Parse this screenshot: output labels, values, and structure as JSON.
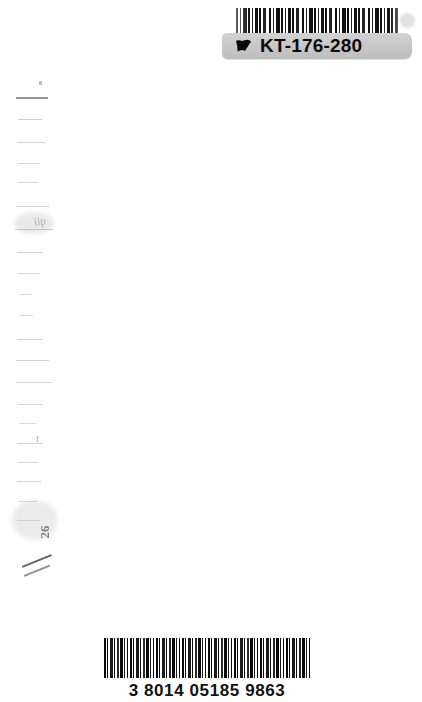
{
  "page": {
    "background_color": "#ffffff",
    "width": 422,
    "height": 702
  },
  "library_label": {
    "code_text": "KT-176-280",
    "flag_icon": "flag-icon",
    "band_color": "#c9c9c9",
    "text_color": "#0d0d0d",
    "barcode_symbology_label": "barcode-code39",
    "dot_color": "#e2e2e2"
  },
  "product_barcode": {
    "number": "3 8014 05185 9863",
    "bar_color": "#0a0a0a",
    "text_color": "#111111"
  },
  "edge_marks": {
    "label": "bleed-through dashes",
    "color": "#8f8f8f",
    "dashes": [
      {
        "x": 16,
        "y": 97,
        "w": 32,
        "h": 2,
        "o": 0.95
      },
      {
        "x": 18,
        "y": 119,
        "w": 24,
        "h": 1,
        "o": 0.4
      },
      {
        "x": 17,
        "y": 142,
        "w": 28,
        "h": 1,
        "o": 0.38
      },
      {
        "x": 18,
        "y": 163,
        "w": 22,
        "h": 1,
        "o": 0.36
      },
      {
        "x": 18,
        "y": 182,
        "w": 20,
        "h": 1,
        "o": 0.34
      },
      {
        "x": 16,
        "y": 206,
        "w": 33,
        "h": 1,
        "o": 0.42
      },
      {
        "x": 15,
        "y": 229,
        "w": 38,
        "h": 1,
        "o": 0.45
      },
      {
        "x": 17,
        "y": 252,
        "w": 26,
        "h": 1,
        "o": 0.4
      },
      {
        "x": 18,
        "y": 273,
        "w": 22,
        "h": 1,
        "o": 0.34
      },
      {
        "x": 19,
        "y": 294,
        "w": 13,
        "h": 1,
        "o": 0.32
      },
      {
        "x": 19,
        "y": 315,
        "w": 14,
        "h": 1,
        "o": 0.32
      },
      {
        "x": 17,
        "y": 339,
        "w": 25,
        "h": 1,
        "o": 0.38
      },
      {
        "x": 16,
        "y": 360,
        "w": 33,
        "h": 1,
        "o": 0.42
      },
      {
        "x": 16,
        "y": 382,
        "w": 36,
        "h": 1,
        "o": 0.4
      },
      {
        "x": 18,
        "y": 404,
        "w": 24,
        "h": 1,
        "o": 0.36
      },
      {
        "x": 19,
        "y": 423,
        "w": 17,
        "h": 1,
        "o": 0.32
      },
      {
        "x": 17,
        "y": 443,
        "w": 26,
        "h": 1,
        "o": 0.38
      },
      {
        "x": 18,
        "y": 462,
        "w": 20,
        "h": 1,
        "o": 0.34
      },
      {
        "x": 17,
        "y": 481,
        "w": 24,
        "h": 1,
        "o": 0.4
      },
      {
        "x": 18,
        "y": 501,
        "w": 19,
        "h": 1,
        "o": 0.32
      },
      {
        "x": 17,
        "y": 520,
        "w": 23,
        "h": 1,
        "o": 0.34
      }
    ],
    "smudge_text": "26",
    "speck_label": "dust-speck"
  }
}
